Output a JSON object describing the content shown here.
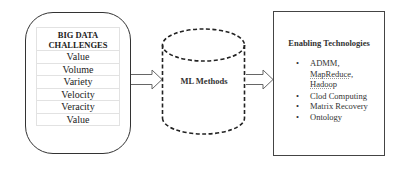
{
  "left_box": {
    "title": "BIG DATA CHALLENGES",
    "items": [
      "Value",
      "Volume",
      "Variety",
      "Velocity",
      "Veracity",
      "Value"
    ]
  },
  "center": {
    "label": "ML Methods",
    "shape": "dashed-cylinder"
  },
  "right_box": {
    "title": "Enabling Technologies",
    "items": [
      {
        "lines": [
          "ADMM,",
          "MapReduce,",
          "Hadoop"
        ]
      },
      {
        "lines": [
          "Clod Computing"
        ]
      },
      {
        "lines": [
          "Matrix Recovery"
        ]
      },
      {
        "lines": [
          "Ontology"
        ]
      }
    ]
  },
  "arrows": [
    {
      "from": "BIG DATA CHALLENGES",
      "to": "ML Methods"
    },
    {
      "from": "ML Methods",
      "to": "Enabling Technologies"
    }
  ],
  "colors": {
    "stroke": "#333333",
    "table_border": "#e2e2e2",
    "background": "#ffffff"
  }
}
